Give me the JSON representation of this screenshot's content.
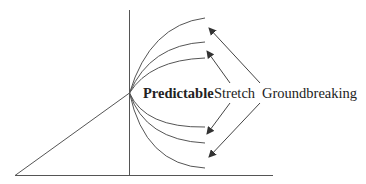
{
  "diagram": {
    "type": "innovation-spectrum",
    "labels": {
      "predictable": "Predictable",
      "stretch": "Stretch",
      "groundbreaking": "Groundbreaking"
    },
    "colors": {
      "line": "#555555",
      "text": "#222222",
      "background": "#ffffff"
    }
  }
}
